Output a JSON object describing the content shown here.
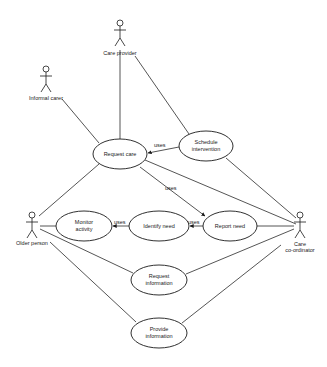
{
  "diagram": {
    "type": "uml-use-case",
    "actors": [
      {
        "id": "care_provider",
        "label": "Care provider",
        "x": 120,
        "y": 28
      },
      {
        "id": "informal_carer",
        "label": "Informal carer",
        "x": 46,
        "y": 76
      },
      {
        "id": "older_person",
        "label": "Older person",
        "x": 32,
        "y": 222
      },
      {
        "id": "care_coordinator",
        "label_line1": "Care",
        "label_line2": "co-ordinator",
        "x": 300,
        "y": 222
      }
    ],
    "use_cases": [
      {
        "id": "request_care",
        "label_line1": "Request care",
        "label_line2": "",
        "cx": 120,
        "cy": 154,
        "rx": 27,
        "ry": 15
      },
      {
        "id": "schedule_intervention",
        "label_line1": "Schedule",
        "label_line2": "intervention",
        "cx": 206,
        "cy": 146,
        "rx": 27,
        "ry": 15
      },
      {
        "id": "monitor_activity",
        "label_line1": "Monitor",
        "label_line2": "activity",
        "cx": 84,
        "cy": 226,
        "rx": 28,
        "ry": 15
      },
      {
        "id": "identify_need",
        "label_line1": "Identify need",
        "label_line2": "",
        "cx": 159,
        "cy": 226,
        "rx": 30,
        "ry": 15
      },
      {
        "id": "report_need",
        "label_line1": "Report need",
        "label_line2": "",
        "cx": 230,
        "cy": 226,
        "rx": 27,
        "ry": 15
      },
      {
        "id": "request_information",
        "label_line1": "Request",
        "label_line2": "information",
        "cx": 159,
        "cy": 280,
        "rx": 28,
        "ry": 15
      },
      {
        "id": "provide_information",
        "label_line1": "Provide",
        "label_line2": "information",
        "cx": 159,
        "cy": 333,
        "rx": 28,
        "ry": 15
      }
    ],
    "relationship_labels": {
      "uses": "uses"
    }
  }
}
